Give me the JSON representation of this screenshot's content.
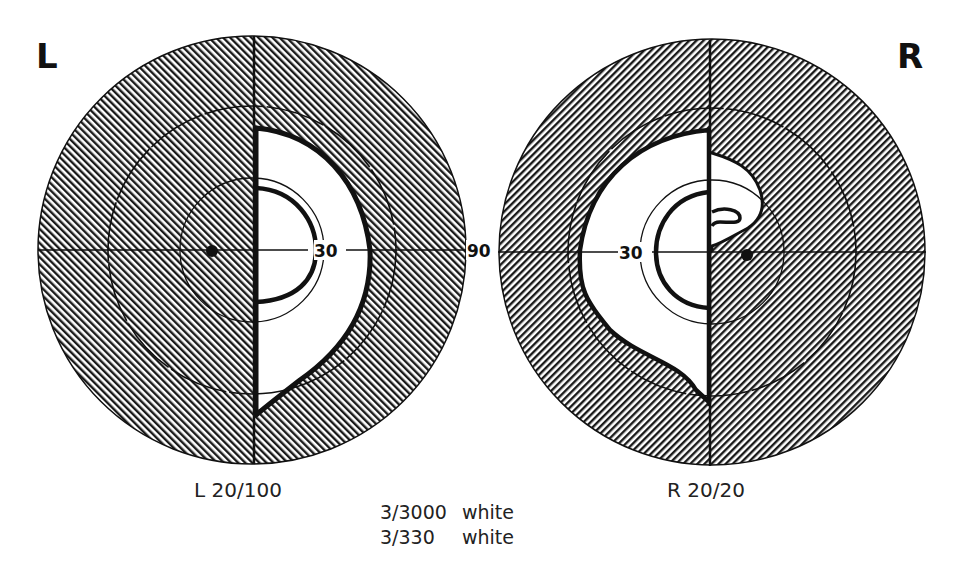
{
  "figure": {
    "type": "visual-field-perimetry-chart",
    "colors": {
      "hatch": "#1a1a1a",
      "background": "#ffffff",
      "isopter": "#111111"
    }
  },
  "left_eye": {
    "letter": "L",
    "acuity_label": "L 20/100",
    "ring_label_30": "30",
    "ring_label_90": "90"
  },
  "right_eye": {
    "letter": "R",
    "acuity_label": "R 20/20",
    "ring_label_30": "30"
  },
  "legend": {
    "rows": [
      {
        "stimulus": "3/3000",
        "color": "white"
      },
      {
        "stimulus": "3/330",
        "color": "white"
      }
    ]
  }
}
